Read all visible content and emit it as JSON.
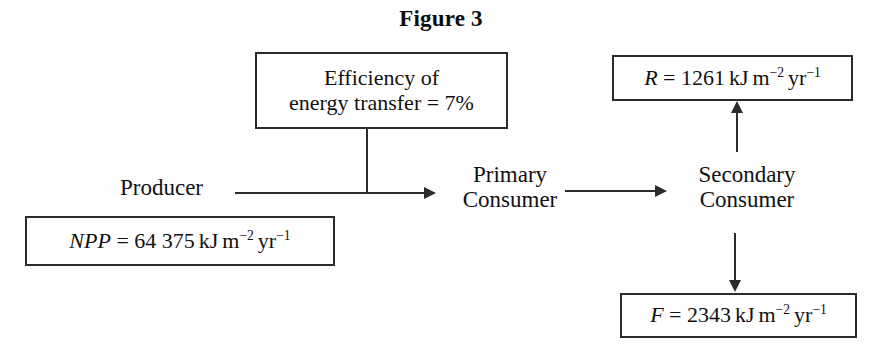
{
  "figure": {
    "title": "Figure 3"
  },
  "nodes": {
    "producer": "Producer",
    "primary_consumer_line1": "Primary",
    "primary_consumer_line2": "Consumer",
    "secondary_consumer_line1": "Secondary",
    "secondary_consumer_line2": "Consumer"
  },
  "boxes": {
    "efficiency": {
      "line1": "Efficiency of",
      "line2_prefix": "energy transfer = ",
      "value": "7%"
    },
    "npp": {
      "symbol": "NPP",
      "equals": " = ",
      "value": "64 375",
      "unit_energy": "kJ",
      "unit_area": "m",
      "unit_area_exp": "−2",
      "unit_time": "yr",
      "unit_time_exp": "−1",
      "full_text": "NPP = 64 375 kJ m−2 yr−1"
    },
    "respiration": {
      "symbol": "R",
      "equals": " = ",
      "value": "1261",
      "unit_energy": "kJ",
      "unit_area": "m",
      "unit_area_exp": "−2",
      "unit_time": "yr",
      "unit_time_exp": "−1",
      "full_text": "R = 1261 kJ m−2 yr−1"
    },
    "faeces": {
      "symbol": "F",
      "equals": " = ",
      "value": "2343",
      "unit_energy": "kJ",
      "unit_area": "m",
      "unit_area_exp": "−2",
      "unit_time": "yr",
      "unit_time_exp": "−1",
      "full_text": "F = 2343 kJ m−2 yr−1"
    }
  },
  "colors": {
    "ink": "#2b2b2b",
    "text": "#111111",
    "background": "#fefefe"
  }
}
